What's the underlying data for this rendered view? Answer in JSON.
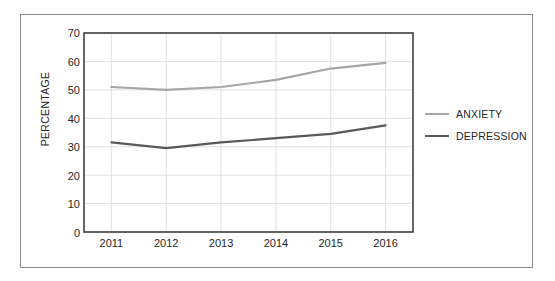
{
  "chart_data": {
    "type": "line",
    "title": "",
    "subtitle": "",
    "xlabel": "",
    "ylabel": "PERCENTAGE",
    "categories": [
      "2011",
      "2012",
      "2013",
      "2014",
      "2015",
      "2016"
    ],
    "series": [
      {
        "name": "ANXIETY",
        "color": "#a6a6a6",
        "values": [
          51,
          50,
          51,
          53.5,
          57.5,
          59.5
        ]
      },
      {
        "name": "DEPRESSION",
        "color": "#595959",
        "values": [
          31.5,
          29.5,
          31.5,
          33,
          34.5,
          37.5
        ]
      }
    ],
    "ylim": [
      0,
      70
    ],
    "ytick_step": 10,
    "yticks": [
      "70",
      "60",
      "50",
      "40",
      "30",
      "20",
      "10",
      "0"
    ],
    "grid": true,
    "grid_color": "#d9d9d9",
    "axis_color": "#404040",
    "legend_position": "right",
    "legend": [
      {
        "label": "ANXIETY",
        "color": "#a6a6a6"
      },
      {
        "label": "DEPRESSION",
        "color": "#595959"
      }
    ]
  }
}
